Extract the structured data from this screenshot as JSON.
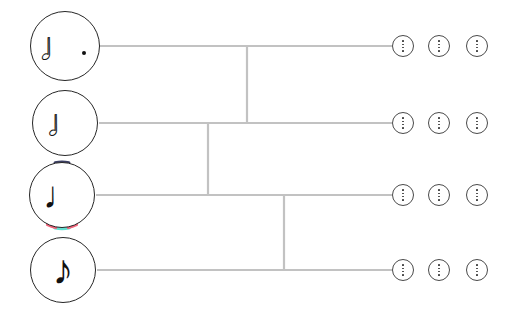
{
  "canvas": {
    "width": 516,
    "height": 322,
    "background": "#ffffff"
  },
  "theme": {
    "line_color": "#c2c2c2",
    "circle_stroke": "#262626",
    "kebab_stroke": "#4a4a4a",
    "glyph_color": "#111111",
    "highlight_teal": "#62ded0",
    "highlight_pink": "#f0637a",
    "highlight_dark": "#3b3f63"
  },
  "nodes": [
    {
      "id": "node-dotted-half",
      "label": "dotted half note",
      "glyph": "♩",
      "glyph_name": "dotted-half-note-icon",
      "cx": 65,
      "cy": 46,
      "r": 35,
      "glyph_size": 40,
      "glyph_dx": -3,
      "glyph_dy": 0,
      "dotted": true,
      "hollow": true,
      "highlighted": false
    },
    {
      "id": "node-half",
      "label": "half note",
      "glyph": "♩",
      "glyph_name": "half-note-icon",
      "cx": 65,
      "cy": 123,
      "r": 33,
      "glyph_size": 38,
      "glyph_dx": 0,
      "glyph_dy": 0,
      "dotted": false,
      "hollow": true,
      "highlighted": false
    },
    {
      "id": "node-quarter",
      "label": "quarter note",
      "glyph": "♩",
      "glyph_name": "quarter-note-icon",
      "cx": 62,
      "cy": 195,
      "r": 33,
      "glyph_size": 38,
      "glyph_dx": 0,
      "glyph_dy": 0,
      "dotted": false,
      "hollow": false,
      "highlighted": true
    },
    {
      "id": "node-eighth",
      "label": "eighth note",
      "glyph": "♪",
      "glyph_name": "eighth-note-icon",
      "cx": 63,
      "cy": 270,
      "r": 33,
      "glyph_size": 42,
      "glyph_dx": 0,
      "glyph_dy": 0,
      "dotted": false,
      "hollow": false,
      "highlighted": false
    }
  ],
  "connectors": {
    "stroke_width": 2.2,
    "horizontals": [
      {
        "name": "branch-row-1",
        "x1": 100,
        "x2": 392,
        "y": 46
      },
      {
        "name": "branch-row-2",
        "x1": 99,
        "x2": 392,
        "y": 123
      },
      {
        "name": "branch-row-3",
        "x1": 96,
        "x2": 392,
        "y": 195
      },
      {
        "name": "branch-row-4",
        "x1": 97,
        "x2": 392,
        "y": 270
      }
    ],
    "verticals": [
      {
        "name": "join-1-2",
        "x": 247,
        "y1": 46,
        "y2": 123
      },
      {
        "name": "join-2-3",
        "x": 208,
        "y1": 123,
        "y2": 195
      },
      {
        "name": "join-3-4",
        "x": 284,
        "y1": 195,
        "y2": 270
      }
    ]
  },
  "kebab_menus": {
    "icon_name": "more-options-icon",
    "label": "more options",
    "radius": 11,
    "dot_count": 4,
    "columns_x": [
      403,
      439,
      477
    ],
    "rows_y": [
      46,
      123,
      195,
      270
    ]
  }
}
